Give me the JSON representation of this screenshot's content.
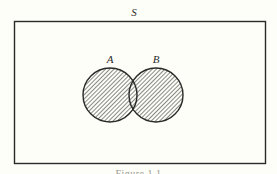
{
  "diagram": {
    "type": "venn",
    "universe": {
      "label": "S",
      "shape": "rectangle",
      "x": 14,
      "y": 21,
      "width": 251,
      "height": 142
    },
    "sets": [
      {
        "label": "A",
        "cx": 110,
        "cy": 95,
        "r": 27,
        "shaded": true
      },
      {
        "label": "B",
        "cx": 156,
        "cy": 95,
        "r": 27,
        "shaded": true
      }
    ],
    "shading": {
      "style": "diagonal-hatch",
      "region": "A ∪ B",
      "line_spacing_px": 3,
      "angle_deg": 45
    },
    "caption": "Figure 1.1"
  },
  "colors": {
    "background": "#fefef8",
    "stroke": "#2a2a2a",
    "hatch": "#4a4a4a"
  }
}
